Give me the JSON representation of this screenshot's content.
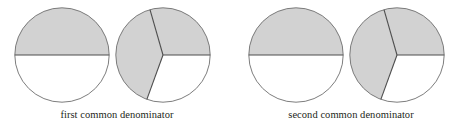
{
  "figure": {
    "background": "#ffffff",
    "shade_color": "#d2d2d2",
    "outline_color": "#6e6e6e",
    "divider_color": "#4d4d4d",
    "text_color": "#231f20",
    "groups": [
      {
        "id": "first",
        "caption": "first common denominator",
        "diagrams": [
          {
            "id": "half-circle",
            "parts": 2,
            "shaded": 1,
            "fraction_text": "1/2",
            "slices": [
              {
                "start_deg": 0,
                "end_deg": 180,
                "shaded": true
              },
              {
                "start_deg": 180,
                "end_deg": 360,
                "shaded": false
              }
            ]
          },
          {
            "id": "thirds-circle",
            "parts": 3,
            "shaded": 2,
            "fraction_text": "2/3",
            "slices": [
              {
                "start_deg": 0,
                "end_deg": 106,
                "shaded": true
              },
              {
                "start_deg": 106,
                "end_deg": 250,
                "shaded": true
              },
              {
                "start_deg": 250,
                "end_deg": 360,
                "shaded": false
              }
            ]
          }
        ]
      },
      {
        "id": "second",
        "caption": "second common denominator",
        "diagrams": [
          {
            "id": "half-circle",
            "parts": 2,
            "shaded": 1,
            "fraction_text": "1/2",
            "slices": [
              {
                "start_deg": 0,
                "end_deg": 180,
                "shaded": true
              },
              {
                "start_deg": 180,
                "end_deg": 360,
                "shaded": false
              }
            ]
          },
          {
            "id": "thirds-circle",
            "parts": 3,
            "shaded": 2,
            "fraction_text": "2/3",
            "slices": [
              {
                "start_deg": 0,
                "end_deg": 106,
                "shaded": true
              },
              {
                "start_deg": 106,
                "end_deg": 250,
                "shaded": true
              },
              {
                "start_deg": 250,
                "end_deg": 360,
                "shaded": false
              }
            ]
          }
        ]
      }
    ]
  }
}
